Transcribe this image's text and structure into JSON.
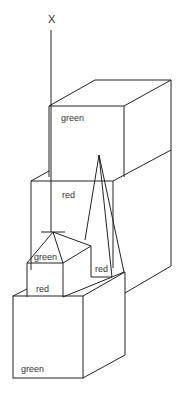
{
  "diagram": {
    "axis_label": "X",
    "labels": {
      "top_box": "green",
      "middle_box": "red",
      "small_roof": "green",
      "small_box": "red",
      "pyramid_base": "red",
      "bottom_box": "green"
    },
    "stroke_color": "#222222",
    "background": "#ffffff"
  }
}
